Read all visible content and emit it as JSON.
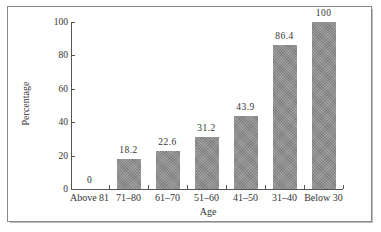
{
  "chart_data": {
    "type": "bar",
    "title": "",
    "xlabel": "Age",
    "ylabel": "Percentage",
    "categories": [
      "Above 81",
      "71–80",
      "61–70",
      "51–60",
      "41–50",
      "31–40",
      "Below 30"
    ],
    "values": [
      0,
      18.2,
      22.6,
      31.2,
      43.9,
      86.4,
      100
    ],
    "value_labels": [
      "0",
      "18.2",
      "22.6",
      "31.2",
      "43.9",
      "86.4",
      "100"
    ],
    "ylim": [
      0,
      100
    ],
    "yticks": [
      "0",
      "20",
      "40",
      "60",
      "80",
      "100"
    ],
    "grid": false,
    "legend": null,
    "bar_color": "#8d8d8d"
  }
}
